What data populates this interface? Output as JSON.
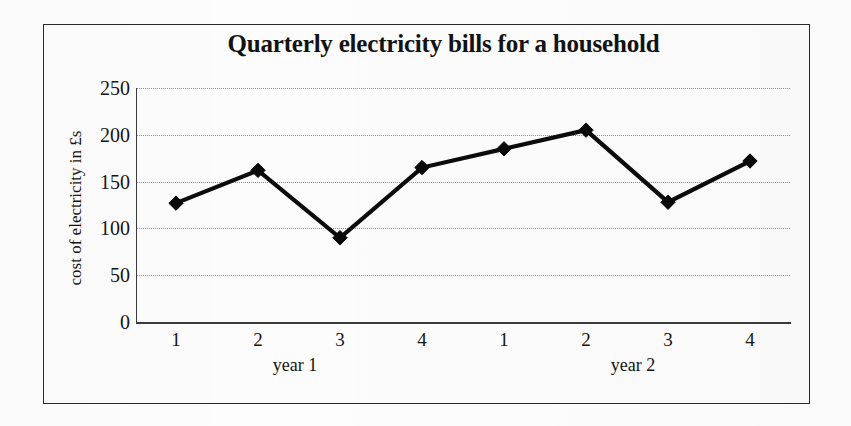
{
  "chart_data": {
    "type": "line",
    "title": "Quarterly electricity bills for a household",
    "xlabel": "",
    "ylabel": "cost of electricity in £s",
    "categories": [
      "1",
      "2",
      "3",
      "4",
      "1",
      "2",
      "3",
      "4"
    ],
    "group_labels": [
      "year 1",
      "year 2"
    ],
    "values": [
      127,
      162,
      90,
      165,
      185,
      205,
      128,
      172
    ],
    "series": [
      {
        "name": "cost of electricity",
        "values": [
          127,
          162,
          90,
          165,
          185,
          205,
          128,
          172
        ]
      }
    ],
    "ylim": [
      0,
      250
    ],
    "ytick_labels": [
      "0",
      "50",
      "100",
      "150",
      "200",
      "250"
    ],
    "ytick_values": [
      0,
      50,
      100,
      150,
      200,
      250
    ],
    "grid": true,
    "legend": "none",
    "marker": "diamond",
    "line_color": "#0b0b0b",
    "grid_color": "#8e8e8e",
    "axis_color": "#3b3b3b"
  },
  "frame": {
    "border_color": "#2a2a2a"
  }
}
